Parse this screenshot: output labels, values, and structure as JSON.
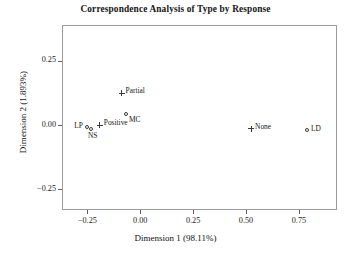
{
  "chart_data": {
    "type": "scatter",
    "title": "Correspondence Analysis of Type by Response",
    "xlabel": "Dimension 1 (98.11%)",
    "ylabel": "Dimension 2 (1.893%)",
    "xlim": [
      -0.37,
      0.93
    ],
    "ylim": [
      -0.33,
      0.39
    ],
    "xticks": [
      "-0.25",
      "0.00",
      "0.25",
      "0.50",
      "0.75"
    ],
    "xtick_values": [
      -0.25,
      0.0,
      0.25,
      0.5,
      0.75
    ],
    "yticks": [
      "0.25",
      "0.00",
      "-0.25"
    ],
    "ytick_values": [
      0.25,
      0.0,
      -0.25
    ],
    "grid": false,
    "legend": "none",
    "series": [
      {
        "name": "Type",
        "marker": "circle",
        "points": [
          {
            "label": "LP",
            "x": -0.255,
            "y": -0.002,
            "label_dx": -13,
            "label_dy": -2
          },
          {
            "label": "NS",
            "x": -0.238,
            "y": -0.012,
            "label_dx": -3,
            "label_dy": 6
          },
          {
            "label": "MC",
            "x": -0.072,
            "y": 0.047,
            "label_dx": 3,
            "label_dy": 5
          },
          {
            "label": "LD",
            "x": 0.783,
            "y": -0.016,
            "label_dx": 4,
            "label_dy": -2
          }
        ]
      },
      {
        "name": "Response",
        "marker": "plus",
        "points": [
          {
            "label": "Positive",
            "x": -0.196,
            "y": 0.004,
            "label_dx": 4,
            "label_dy": -3
          },
          {
            "label": "Partial",
            "x": -0.093,
            "y": 0.128,
            "label_dx": 4,
            "label_dy": -3
          },
          {
            "label": "None",
            "x": 0.519,
            "y": -0.009,
            "label_dx": 4,
            "label_dy": -3
          }
        ]
      }
    ]
  }
}
